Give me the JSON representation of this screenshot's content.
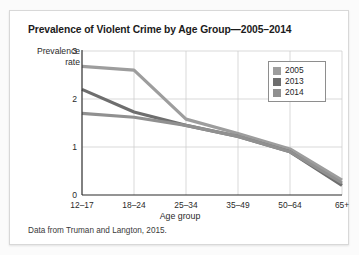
{
  "figure": {
    "title": "Prevalence of Violent Crime by Age Group—2005–2014",
    "source_note": "Data from Truman and Langton, 2015.",
    "ylabel_line1": "Prevalence",
    "ylabel_line2": "rate"
  },
  "chart_data": {
    "type": "line",
    "title": "Prevalence of Violent Crime by Age Group—2005–2014",
    "xlabel": "Age group",
    "ylabel": "Prevalence rate",
    "categories": [
      "12–17",
      "18–24",
      "25–34",
      "35–49",
      "50–64",
      "65+"
    ],
    "ylim": [
      0,
      3
    ],
    "yticks": [
      0,
      1,
      2,
      3
    ],
    "grid": true,
    "legend_position": "top-right",
    "series": [
      {
        "name": "2005",
        "color": "#9d9d9d",
        "values": [
          2.68,
          2.6,
          1.58,
          1.28,
          0.96,
          0.31
        ]
      },
      {
        "name": "2013",
        "color": "#6e6e6e",
        "values": [
          2.2,
          1.73,
          1.45,
          1.22,
          0.9,
          0.2
        ]
      },
      {
        "name": "2014",
        "color": "#909090",
        "values": [
          1.7,
          1.62,
          1.45,
          1.22,
          0.9,
          0.25
        ]
      }
    ]
  },
  "colors": {
    "axis": "#2a2a2a",
    "grid": "#cfcfcf",
    "series_2005": "#9d9d9d",
    "series_2013": "#6e6e6e",
    "series_2014": "#909090"
  }
}
